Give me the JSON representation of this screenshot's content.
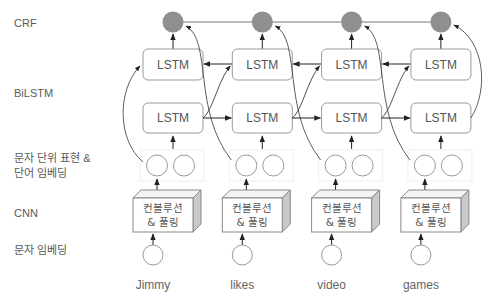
{
  "row_labels": {
    "crf": "CRF",
    "bilstm": "BiLSTM",
    "char_word_repr": "문자 단위 표현 &\n단어 임베딩",
    "cnn": "CNN",
    "char_embedding": "문자 임베딩"
  },
  "nodes": {
    "lstm_label": "LSTM",
    "cnn_label_line1": "컨볼루션",
    "cnn_label_line2": "& 풀링"
  },
  "words": [
    "Jimmy",
    "likes",
    "video",
    "games"
  ],
  "colors": {
    "crf_fill": "#8f8f8f",
    "stroke": "#9a9a9a",
    "arrow": "#222222",
    "cnn_side": "#c9c9c9",
    "embed_box": "#eeeeee"
  }
}
